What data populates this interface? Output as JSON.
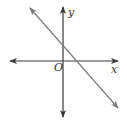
{
  "diagram": {
    "type": "coordinate-plane-line",
    "axes": {
      "x_label": "x",
      "y_label": "y",
      "origin_label": "O",
      "axis_color": "#3a3a3a"
    },
    "line": {
      "description": "straight line with negative slope, positive y-intercept and positive x-intercept",
      "color": "#7a7a7a",
      "slope_sign": "negative",
      "y_intercept_sign": "positive",
      "x_intercept_sign": "positive"
    }
  }
}
